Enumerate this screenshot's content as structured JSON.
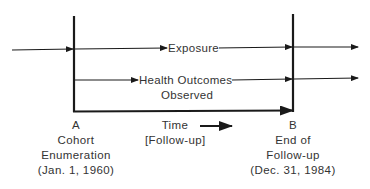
{
  "diagram": {
    "type": "cohort-study-timeline",
    "rows": {
      "exposure": {
        "label": "Exposure"
      },
      "outcomes": {
        "label_line1": "Health Outcomes",
        "label_line2": "Observed"
      }
    },
    "time_axis": {
      "label_line1": "Time",
      "label_line2": "[Follow-up]"
    },
    "point_a": {
      "letter": "A",
      "line1": "Cohort",
      "line2": "Enumeration",
      "line3": "(Jan. 1, 1960)"
    },
    "point_b": {
      "letter": "B",
      "line1": "End of",
      "line2": "Follow-up",
      "line3": "(Dec. 31, 1984)"
    },
    "colors": {
      "line": "#1a1a1a",
      "text": "#333333",
      "background": "#ffffff"
    }
  }
}
